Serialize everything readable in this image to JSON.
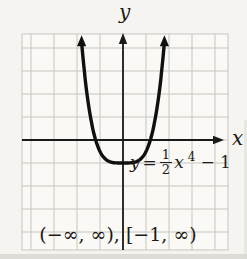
{
  "figure": {
    "y_axis_label": "y",
    "x_axis_label": "x",
    "equation": {
      "lhs_variable": "y",
      "equals": "=",
      "numerator": "1",
      "denominator": "2",
      "variable": "x",
      "exponent": "4",
      "constant_term": "− 1"
    },
    "caption": {
      "domain_part": "(−∞, ∞),",
      "range_part": "[−1, ∞)"
    }
  },
  "chart_data": {
    "type": "line",
    "title": "",
    "xlabel": "x",
    "ylabel": "y",
    "equation_text": "y = (1/2)x⁴ − 1",
    "function": {
      "coefficient": 0.5,
      "exponent": 4,
      "constant": -1
    },
    "curve_t_extent": 1.8,
    "grid": true,
    "grid_unit": 1,
    "x_visible": [
      -4.4,
      4.6
    ],
    "y_visible": [
      -4.8,
      4.6
    ],
    "vertex": [
      0,
      -1
    ],
    "y_intercept": -1,
    "x_intercepts": [
      -1.19,
      1.19
    ],
    "domain_interval": "(−∞, ∞)",
    "range_interval": "[−1, ∞)",
    "legend": "none",
    "axis_ticks_labeled": false,
    "sample_points": [
      [
        -1.8,
        4.25
      ],
      [
        -1.5,
        1.53
      ],
      [
        -1.19,
        0
      ],
      [
        -1,
        -0.5
      ],
      [
        0,
        -1
      ],
      [
        1,
        -0.5
      ],
      [
        1.19,
        0
      ],
      [
        1.5,
        1.53
      ],
      [
        1.8,
        4.25
      ]
    ]
  },
  "colors": {
    "background": "#f5f4f0",
    "paper": "#faf9f5",
    "grid_line": "#c7c6c1",
    "axis": "#1a1a18",
    "curve": "#101010",
    "text": "#1d1c19"
  }
}
